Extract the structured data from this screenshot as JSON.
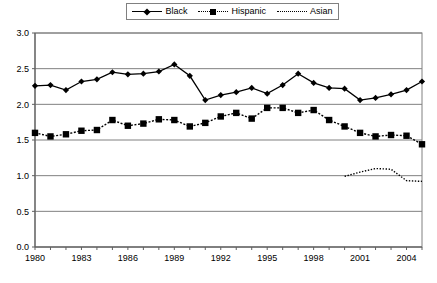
{
  "legend": {
    "position": "top-center",
    "entries": [
      {
        "label": "Black",
        "marker": "diamond",
        "line": "solid",
        "icon": "diamond-marker-icon"
      },
      {
        "label": "Hispanic",
        "marker": "square",
        "line": "dash-dot",
        "icon": "square-marker-icon"
      },
      {
        "label": "Asian",
        "marker": "none",
        "line": "dotted",
        "icon": "dotted-line-icon"
      }
    ]
  },
  "chart_data": {
    "type": "line",
    "title": "",
    "subtitle": "",
    "xlabel": "",
    "ylabel": "",
    "xlim": [
      1980,
      2005
    ],
    "ylim": [
      0.0,
      3.0
    ],
    "grid": true,
    "x": [
      1980,
      1981,
      1982,
      1983,
      1984,
      1985,
      1986,
      1987,
      1988,
      1989,
      1990,
      1991,
      1992,
      1993,
      1994,
      1995,
      1996,
      1997,
      1998,
      1999,
      2000,
      2001,
      2002,
      2003,
      2004,
      2005
    ],
    "ytick_labels": [
      "0.0",
      "0.5",
      "1.0",
      "1.5",
      "2.0",
      "2.5",
      "3.0"
    ],
    "ytick_values": [
      0.0,
      0.5,
      1.0,
      1.5,
      2.0,
      2.5,
      3.0
    ],
    "xtick_labels": [
      "1980",
      "1983",
      "1986",
      "1989",
      "1992",
      "1995",
      "1998",
      "2001",
      "2004"
    ],
    "xtick_values": [
      1980,
      1983,
      1986,
      1989,
      1992,
      1995,
      1998,
      2001,
      2004
    ],
    "series": [
      {
        "name": "Black",
        "marker": "diamond",
        "line": "solid",
        "color": "#000000",
        "x": [
          1980,
          1981,
          1982,
          1983,
          1984,
          1985,
          1986,
          1987,
          1988,
          1989,
          1990,
          1991,
          1992,
          1993,
          1994,
          1995,
          1996,
          1997,
          1998,
          1999,
          2000,
          2001,
          2002,
          2003,
          2004,
          2005
        ],
        "values": [
          2.26,
          2.27,
          2.2,
          2.32,
          2.35,
          2.45,
          2.42,
          2.43,
          2.46,
          2.56,
          2.4,
          2.06,
          2.13,
          2.17,
          2.23,
          2.15,
          2.27,
          2.43,
          2.3,
          2.23,
          2.22,
          2.06,
          2.09,
          2.14,
          2.2,
          2.32
        ]
      },
      {
        "name": "Hispanic",
        "marker": "square",
        "line": "dash-dot",
        "color": "#000000",
        "x": [
          1980,
          1981,
          1982,
          1983,
          1984,
          1985,
          1986,
          1987,
          1988,
          1989,
          1990,
          1991,
          1992,
          1993,
          1994,
          1995,
          1996,
          1997,
          1998,
          1999,
          2000,
          2001,
          2002,
          2003,
          2004,
          2005
        ],
        "values": [
          1.6,
          1.55,
          1.58,
          1.63,
          1.64,
          1.78,
          1.7,
          1.73,
          1.79,
          1.78,
          1.69,
          1.74,
          1.83,
          1.88,
          1.8,
          1.95,
          1.95,
          1.88,
          1.92,
          1.78,
          1.69,
          1.6,
          1.55,
          1.57,
          1.56,
          1.44
        ]
      },
      {
        "name": "Asian",
        "marker": "none",
        "line": "dotted",
        "color": "#000000",
        "x": [
          2000,
          2001,
          2002,
          2003,
          2004,
          2005
        ],
        "values": [
          0.99,
          1.05,
          1.1,
          1.09,
          0.93,
          0.92
        ]
      }
    ]
  }
}
